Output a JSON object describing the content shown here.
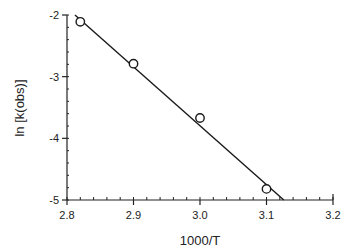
{
  "chart_data": {
    "type": "scatter",
    "title": "",
    "xlabel": "1000/T",
    "ylabel": "ln [k(obs)]",
    "xlim": [
      2.8,
      3.2
    ],
    "ylim": [
      -5,
      -2
    ],
    "x_ticks": [
      2.8,
      2.9,
      3.0,
      3.1,
      3.2
    ],
    "x_tick_labels": [
      "2.8",
      "2.9",
      "3.0",
      "3.1",
      "3.2"
    ],
    "x_minor_step": 0.02,
    "y_ticks": [
      -2,
      -3,
      -4,
      -5
    ],
    "y_tick_labels": [
      "-2",
      "-3",
      "-4",
      "-5"
    ],
    "y_minor_step": 0.2,
    "grid": false,
    "legend": null,
    "series": [
      {
        "name": "observed",
        "marker": "open-circle",
        "x": [
          2.82,
          2.9,
          3.0,
          3.1
        ],
        "y": [
          -2.11,
          -2.79,
          -3.67,
          -4.82
        ]
      }
    ],
    "fit_line": {
      "name": "linear fit",
      "x": [
        2.812,
        3.126
      ],
      "y": [
        -2.0,
        -5.0
      ]
    },
    "colors": {
      "axis": "#222222",
      "line": "#1a1a1a",
      "marker": "#1a1a1a",
      "background": "#ffffff"
    }
  }
}
